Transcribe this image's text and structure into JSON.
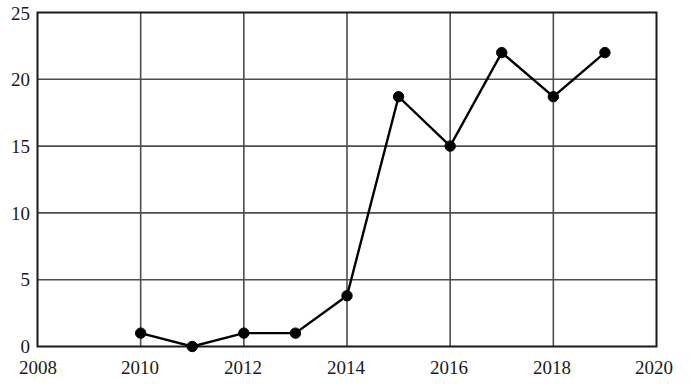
{
  "chart_data": {
    "type": "line",
    "title": "",
    "subtitle": "",
    "xlabel": "",
    "ylabel": "",
    "x": [
      2010,
      2011,
      2012,
      2013,
      2014,
      2015,
      2016,
      2017,
      2018,
      2019
    ],
    "values": [
      1,
      0,
      1,
      1,
      3.8,
      18.7,
      15,
      22,
      18.7,
      22
    ],
    "series": [
      {
        "name": "",
        "x": [
          2010,
          2011,
          2012,
          2013,
          2014,
          2015,
          2016,
          2017,
          2018,
          2019
        ],
        "values": [
          1,
          0,
          1,
          1,
          3.8,
          18.7,
          15,
          22,
          18.7,
          22
        ]
      }
    ],
    "xlim": [
      2008,
      2020
    ],
    "ylim": [
      0,
      25
    ],
    "x_ticks": [
      2008,
      2010,
      2012,
      2014,
      2016,
      2018,
      2020
    ],
    "x_tick_labels": [
      "2008",
      "2010",
      "2012",
      "2014",
      "2016",
      "2018",
      "2020"
    ],
    "y_ticks": [
      0,
      5,
      10,
      15,
      20,
      25
    ],
    "y_tick_labels": [
      "0",
      "5",
      "10",
      "15",
      "20",
      "25"
    ],
    "grid": true,
    "grid_x": true,
    "grid_y": true,
    "legend": false,
    "legend_position": "none",
    "marker": "circle",
    "marker_color": "#000000",
    "line_color": "#000000",
    "grid_color": "#4d4d4d",
    "axis_color": "#1a1a1a",
    "background_color": "#ffffff",
    "annotations": []
  },
  "axis": {
    "y_labels": [
      "25",
      "20",
      "15",
      "10",
      "5",
      "0"
    ],
    "x_labels": [
      "2008",
      "2010",
      "2012",
      "2014",
      "2016",
      "2018",
      "2020"
    ]
  }
}
